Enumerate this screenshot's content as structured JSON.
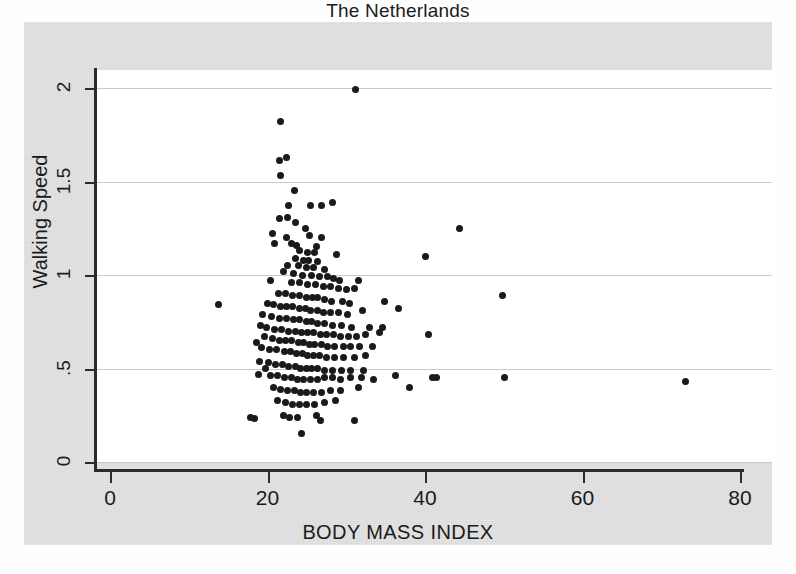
{
  "chart_data": {
    "type": "scatter",
    "title": "The Netherlands",
    "xlabel": "BODY MASS INDEX",
    "ylabel": "Walking Speed",
    "xlim": [
      0,
      80
    ],
    "ylim": [
      0,
      2
    ],
    "xticks": [
      0,
      20,
      40,
      60,
      80
    ],
    "xticklabels": [
      "0",
      "20",
      "40",
      "60",
      "80"
    ],
    "yticks": [
      0,
      0.5,
      1,
      1.5,
      2
    ],
    "yticklabels": [
      "0",
      ".5",
      "1",
      "1.5",
      "2"
    ],
    "grid": "horizontal",
    "legend": "none",
    "marker": "filled-circle",
    "marker_color": "#1a1a1a",
    "plot_background": "#ffffff",
    "figure_background": "#d9d9d9",
    "series": [
      {
        "name": "participants",
        "points": [
          [
            31.2,
            1.99
          ],
          [
            21.6,
            1.82
          ],
          [
            21.5,
            1.61
          ],
          [
            22.4,
            1.63
          ],
          [
            21.7,
            1.53
          ],
          [
            23.4,
            1.45
          ],
          [
            22.7,
            1.37
          ],
          [
            25.4,
            1.37
          ],
          [
            26.9,
            1.37
          ],
          [
            28.3,
            1.39
          ],
          [
            21.5,
            1.3
          ],
          [
            22.6,
            1.31
          ],
          [
            23.5,
            1.28
          ],
          [
            24.8,
            1.25
          ],
          [
            44.4,
            1.25
          ],
          [
            20.6,
            1.22
          ],
          [
            22.4,
            1.2
          ],
          [
            25.3,
            1.21
          ],
          [
            26.9,
            1.2
          ],
          [
            20.9,
            1.17
          ],
          [
            23.1,
            1.17
          ],
          [
            23.7,
            1.16
          ],
          [
            26.2,
            1.15
          ],
          [
            24.1,
            1.13
          ],
          [
            25.1,
            1.12
          ],
          [
            26.0,
            1.12
          ],
          [
            28.7,
            1.11
          ],
          [
            40.1,
            1.1
          ],
          [
            23.6,
            1.09
          ],
          [
            24.6,
            1.08
          ],
          [
            25.2,
            1.08
          ],
          [
            26.4,
            1.07
          ],
          [
            22.6,
            1.05
          ],
          [
            23.9,
            1.05
          ],
          [
            24.9,
            1.04
          ],
          [
            25.9,
            1.04
          ],
          [
            27.3,
            1.03
          ],
          [
            22.0,
            1.02
          ],
          [
            23.3,
            1.01
          ],
          [
            24.4,
            1.0
          ],
          [
            25.6,
            1.0
          ],
          [
            26.6,
            0.99
          ],
          [
            27.6,
            0.99
          ],
          [
            28.4,
            0.98
          ],
          [
            29.2,
            0.97
          ],
          [
            31.6,
            0.97
          ],
          [
            20.4,
            0.97
          ],
          [
            23.1,
            0.96
          ],
          [
            24.0,
            0.96
          ],
          [
            25.1,
            0.95
          ],
          [
            26.1,
            0.95
          ],
          [
            27.1,
            0.94
          ],
          [
            28.0,
            0.94
          ],
          [
            29.0,
            0.93
          ],
          [
            30.0,
            0.92
          ],
          [
            31.0,
            0.93
          ],
          [
            13.8,
            0.84
          ],
          [
            21.4,
            0.9
          ],
          [
            22.3,
            0.9
          ],
          [
            23.2,
            0.89
          ],
          [
            24.1,
            0.89
          ],
          [
            24.9,
            0.88
          ],
          [
            25.7,
            0.88
          ],
          [
            26.4,
            0.88
          ],
          [
            27.2,
            0.87
          ],
          [
            28.1,
            0.86
          ],
          [
            29.5,
            0.86
          ],
          [
            30.4,
            0.85
          ],
          [
            34.8,
            0.86
          ],
          [
            49.9,
            0.89
          ],
          [
            20.0,
            0.85
          ],
          [
            20.8,
            0.84
          ],
          [
            21.6,
            0.83
          ],
          [
            22.4,
            0.83
          ],
          [
            23.2,
            0.83
          ],
          [
            24.0,
            0.82
          ],
          [
            24.8,
            0.82
          ],
          [
            25.5,
            0.81
          ],
          [
            26.3,
            0.81
          ],
          [
            27.1,
            0.8
          ],
          [
            28.0,
            0.8
          ],
          [
            29.0,
            0.8
          ],
          [
            30.2,
            0.79
          ],
          [
            32.1,
            0.81
          ],
          [
            36.6,
            0.82
          ],
          [
            19.4,
            0.79
          ],
          [
            20.5,
            0.78
          ],
          [
            21.5,
            0.77
          ],
          [
            22.4,
            0.77
          ],
          [
            23.3,
            0.76
          ],
          [
            24.1,
            0.76
          ],
          [
            24.9,
            0.75
          ],
          [
            25.6,
            0.75
          ],
          [
            26.4,
            0.74
          ],
          [
            27.3,
            0.74
          ],
          [
            28.3,
            0.73
          ],
          [
            29.4,
            0.73
          ],
          [
            30.7,
            0.72
          ],
          [
            33.0,
            0.72
          ],
          [
            34.6,
            0.72
          ],
          [
            19.1,
            0.73
          ],
          [
            19.9,
            0.72
          ],
          [
            20.9,
            0.71
          ],
          [
            21.8,
            0.71
          ],
          [
            22.7,
            0.7
          ],
          [
            23.5,
            0.7
          ],
          [
            24.3,
            0.69
          ],
          [
            25.1,
            0.69
          ],
          [
            25.9,
            0.69
          ],
          [
            26.7,
            0.68
          ],
          [
            27.5,
            0.68
          ],
          [
            28.4,
            0.68
          ],
          [
            29.3,
            0.67
          ],
          [
            30.3,
            0.67
          ],
          [
            31.3,
            0.67
          ],
          [
            32.4,
            0.68
          ],
          [
            34.2,
            0.69
          ],
          [
            40.4,
            0.68
          ],
          [
            19.6,
            0.67
          ],
          [
            20.6,
            0.66
          ],
          [
            21.5,
            0.65
          ],
          [
            22.3,
            0.65
          ],
          [
            23.1,
            0.65
          ],
          [
            23.9,
            0.64
          ],
          [
            24.6,
            0.64
          ],
          [
            25.3,
            0.63
          ],
          [
            26.0,
            0.63
          ],
          [
            26.8,
            0.63
          ],
          [
            27.6,
            0.62
          ],
          [
            28.5,
            0.62
          ],
          [
            29.6,
            0.62
          ],
          [
            30.6,
            0.62
          ],
          [
            31.7,
            0.62
          ],
          [
            33.3,
            0.62
          ],
          [
            18.6,
            0.64
          ],
          [
            19.3,
            0.61
          ],
          [
            20.3,
            0.6
          ],
          [
            21.2,
            0.6
          ],
          [
            22.1,
            0.59
          ],
          [
            22.9,
            0.59
          ],
          [
            23.7,
            0.58
          ],
          [
            24.4,
            0.58
          ],
          [
            25.1,
            0.57
          ],
          [
            25.8,
            0.57
          ],
          [
            26.6,
            0.57
          ],
          [
            27.5,
            0.56
          ],
          [
            28.5,
            0.56
          ],
          [
            29.6,
            0.56
          ],
          [
            31.1,
            0.56
          ],
          [
            32.5,
            0.57
          ],
          [
            19.0,
            0.54
          ],
          [
            20.1,
            0.53
          ],
          [
            21.0,
            0.52
          ],
          [
            21.9,
            0.52
          ],
          [
            22.7,
            0.51
          ],
          [
            23.5,
            0.51
          ],
          [
            24.2,
            0.5
          ],
          [
            24.9,
            0.5
          ],
          [
            25.6,
            0.5
          ],
          [
            26.4,
            0.5
          ],
          [
            27.3,
            0.49
          ],
          [
            28.3,
            0.49
          ],
          [
            29.4,
            0.49
          ],
          [
            30.6,
            0.49
          ],
          [
            32.2,
            0.49
          ],
          [
            19.7,
            0.5
          ],
          [
            18.9,
            0.47
          ],
          [
            20.4,
            0.46
          ],
          [
            21.3,
            0.46
          ],
          [
            22.2,
            0.45
          ],
          [
            23.0,
            0.45
          ],
          [
            23.8,
            0.44
          ],
          [
            24.6,
            0.44
          ],
          [
            25.4,
            0.44
          ],
          [
            26.3,
            0.44
          ],
          [
            27.2,
            0.45
          ],
          [
            28.2,
            0.45
          ],
          [
            29.3,
            0.44
          ],
          [
            30.5,
            0.45
          ],
          [
            31.9,
            0.45
          ],
          [
            33.5,
            0.44
          ],
          [
            36.2,
            0.46
          ],
          [
            41.0,
            0.45
          ],
          [
            41.4,
            0.45
          ],
          [
            50.1,
            0.45
          ],
          [
            73.1,
            0.43
          ],
          [
            20.8,
            0.4
          ],
          [
            21.7,
            0.39
          ],
          [
            22.6,
            0.38
          ],
          [
            23.4,
            0.38
          ],
          [
            24.2,
            0.37
          ],
          [
            25.0,
            0.37
          ],
          [
            25.9,
            0.37
          ],
          [
            26.9,
            0.37
          ],
          [
            28.0,
            0.38
          ],
          [
            29.3,
            0.38
          ],
          [
            31.5,
            0.4
          ],
          [
            38.0,
            0.4
          ],
          [
            21.3,
            0.33
          ],
          [
            22.3,
            0.32
          ],
          [
            23.2,
            0.31
          ],
          [
            24.1,
            0.31
          ],
          [
            25.0,
            0.31
          ],
          [
            26.0,
            0.31
          ],
          [
            27.2,
            0.32
          ],
          [
            28.6,
            0.33
          ],
          [
            17.8,
            0.24
          ],
          [
            18.4,
            0.23
          ],
          [
            22.0,
            0.25
          ],
          [
            22.8,
            0.24
          ],
          [
            23.8,
            0.24
          ],
          [
            26.2,
            0.25
          ],
          [
            26.7,
            0.22
          ],
          [
            31.0,
            0.22
          ],
          [
            24.3,
            0.15
          ]
        ]
      }
    ]
  }
}
